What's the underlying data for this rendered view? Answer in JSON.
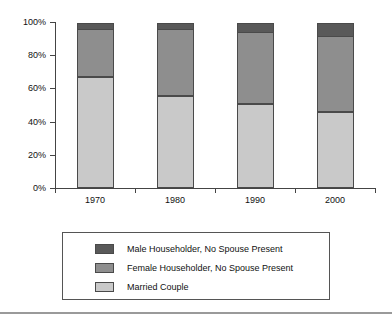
{
  "chart_data": {
    "type": "bar",
    "stacked": true,
    "stack_mode": "percent",
    "title": "",
    "subtitle": "",
    "xlabel": "",
    "ylabel": "",
    "categories": [
      "1970",
      "1980",
      "1990",
      "2000"
    ],
    "series": [
      {
        "name": "Married Couple",
        "color": "#c9c9c9",
        "values": [
          67.0,
          55.5,
          50.5,
          46.0
        ]
      },
      {
        "name": "Female Householder, No Spouse Present",
        "color": "#8e8e8e",
        "values": [
          29.0,
          40.5,
          43.5,
          45.5
        ]
      },
      {
        "name": "Male Householder, No Spouse Present",
        "color": "#595959",
        "values": [
          4.0,
          4.0,
          6.0,
          8.5
        ]
      }
    ],
    "stack_order_bottom_to_top": [
      "Married Couple",
      "Female Householder, No Spouse Present",
      "Male Householder, No Spouse Present"
    ],
    "ylim": [
      0,
      100
    ],
    "yticks": [
      "0%",
      "20%",
      "40%",
      "60%",
      "80%",
      "100%"
    ],
    "ytick_values": [
      0,
      20,
      40,
      60,
      80,
      100
    ],
    "grid": false,
    "legend_position": "bottom"
  },
  "axis": {
    "y_tick_labels": [
      "100%",
      "80%",
      "60%",
      "40%",
      "20%",
      "0%"
    ],
    "x_tick_labels": [
      "1970",
      "1980",
      "1990",
      "2000"
    ]
  },
  "legend": {
    "entries": [
      {
        "label": "Male Householder, No Spouse Present",
        "color": "#595959"
      },
      {
        "label": "Female Householder, No Spouse Present",
        "color": "#8e8e8e"
      },
      {
        "label": "Married Couple",
        "color": "#c9c9c9"
      }
    ]
  },
  "colors": {
    "male_householder": "#595959",
    "female_householder": "#8e8e8e",
    "married_couple": "#c9c9c9",
    "axis": "#444444",
    "bar_outline": "#4a4a4a",
    "rule": "#9a9a9a",
    "background": "#ffffff"
  }
}
